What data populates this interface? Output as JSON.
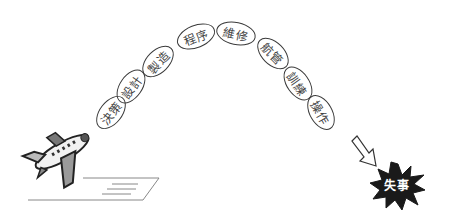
{
  "diagram": {
    "type": "error-chain",
    "chain_links": [
      {
        "label": "決策",
        "cx": 111,
        "cy": 112,
        "rot": -52
      },
      {
        "label": "設計",
        "cx": 131,
        "cy": 86,
        "rot": -55
      },
      {
        "label": "製造",
        "cx": 158,
        "cy": 61,
        "rot": -45
      },
      {
        "label": "程序",
        "cx": 195,
        "cy": 36,
        "rot": -22
      },
      {
        "label": "維修",
        "cx": 236,
        "cy": 33,
        "rot": 12
      },
      {
        "label": "航管",
        "cx": 273,
        "cy": 53,
        "rot": 45
      },
      {
        "label": "訓練",
        "cx": 298,
        "cy": 83,
        "rot": 55
      },
      {
        "label": "操作",
        "cx": 321,
        "cy": 112,
        "rot": 60
      }
    ],
    "outcome": {
      "label": "失事"
    },
    "colors": {
      "stroke": "#3a3a3a",
      "text": "#444444",
      "burst": "#1a1a1a",
      "burst_text": "#ffffff"
    }
  }
}
